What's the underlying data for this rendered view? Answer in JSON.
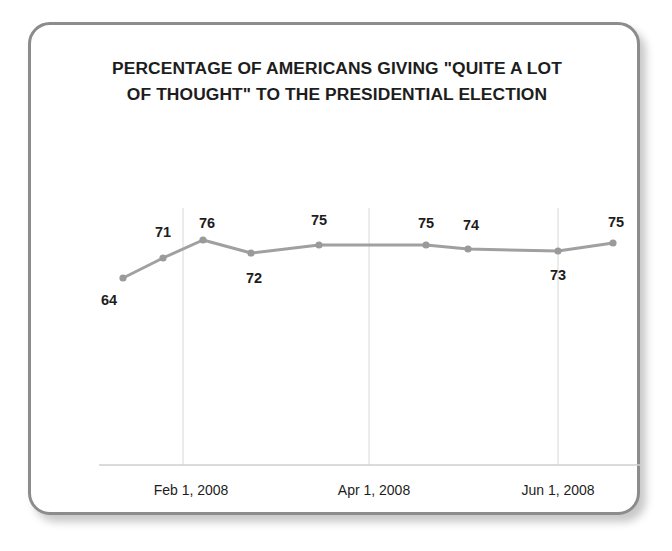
{
  "chart_data": {
    "type": "line",
    "title": "PERCENTAGE OF AMERICANS GIVING \"QUITE A LOT\nOF THOUGHT\" TO THE PRESIDENTIAL ELECTION",
    "xlabel": "",
    "ylabel": "",
    "ylim": [
      60,
      80
    ],
    "grid": true,
    "legend": null,
    "series": [
      {
        "name": "Percentage giving quite a lot of thought",
        "values": [
          64,
          71,
          76,
          72,
          75,
          75,
          74,
          73,
          75
        ]
      }
    ],
    "points": [
      {
        "value": 64,
        "label": "64",
        "x": 92,
        "y": 253,
        "label_x": 78,
        "label_y": 275
      },
      {
        "value": 71,
        "label": "71",
        "x": 132,
        "y": 233,
        "label_x": 132,
        "label_y": 207
      },
      {
        "value": 76,
        "label": "76",
        "x": 172,
        "y": 215,
        "label_x": 176,
        "label_y": 198
      },
      {
        "value": 72,
        "label": "72",
        "x": 220,
        "y": 228,
        "label_x": 223,
        "label_y": 253
      },
      {
        "value": 75,
        "label": "75",
        "x": 288,
        "y": 220,
        "label_x": 288,
        "label_y": 195
      },
      {
        "value": 75,
        "label": "75",
        "x": 395,
        "y": 220,
        "label_x": 395,
        "label_y": 198
      },
      {
        "value": 74,
        "label": "74",
        "x": 437,
        "y": 224,
        "label_x": 440,
        "label_y": 200
      },
      {
        "value": 73,
        "label": "73",
        "x": 527,
        "y": 226,
        "label_x": 527,
        "label_y": 250
      },
      {
        "value": 75,
        "label": "75",
        "x": 582,
        "y": 218,
        "label_x": 585,
        "label_y": 197
      }
    ],
    "gridlines": [
      {
        "x": 152
      },
      {
        "x": 338
      },
      {
        "x": 527
      }
    ],
    "tick_labels": [
      {
        "text": "Feb 1, 2008",
        "x": 160
      },
      {
        "text": "Apr 1, 2008",
        "x": 343
      },
      {
        "text": "Jun 1, 2008",
        "x": 527
      }
    ],
    "axis": {
      "x_start": 68,
      "x_end": 610,
      "y": 440,
      "top": 183
    },
    "colors": {
      "line": "#a0a0a0",
      "marker": "#9a9a9a",
      "gridline": "#d8d8d8",
      "axis": "#cfcfcf",
      "text": "#1d1d1d",
      "border": "#8c8c8c",
      "background": "#ffffff"
    }
  }
}
